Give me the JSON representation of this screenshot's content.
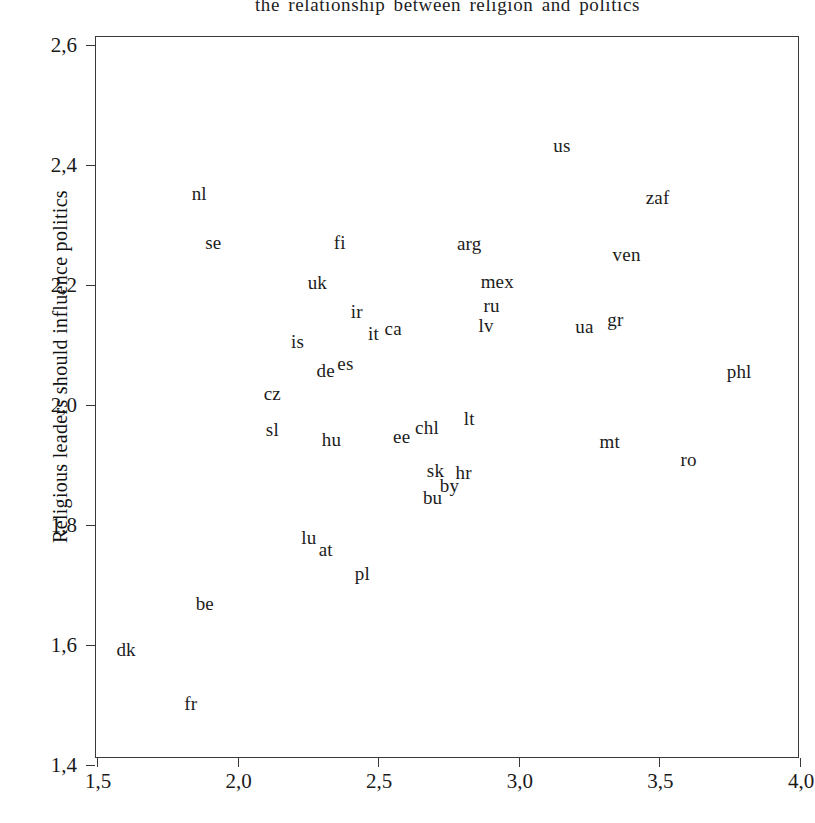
{
  "chart_data": {
    "type": "scatter",
    "title": "the relationship between religion and politics",
    "xlabel": "",
    "ylabel": "Religious leaders should influence politics",
    "xlim": [
      1.5,
      4.0
    ],
    "ylim": [
      1.4,
      2.6
    ],
    "xticks": [
      "1,5",
      "2,0",
      "2,5",
      "3,0",
      "3,5",
      "4,0"
    ],
    "xtick_values": [
      1.5,
      2.0,
      2.5,
      3.0,
      3.5,
      4.0
    ],
    "yticks": [
      "1,4",
      "1,6",
      "1,8",
      "2,0",
      "2,2",
      "2,4",
      "2,6"
    ],
    "ytick_values": [
      1.4,
      1.6,
      1.8,
      2.0,
      2.2,
      2.4,
      2.6
    ],
    "grid": false,
    "legend": null,
    "marker_style": "text-label",
    "decimal_separator": ",",
    "points": [
      {
        "label": "nl",
        "x": 1.86,
        "y": 2.355
      },
      {
        "label": "se",
        "x": 1.91,
        "y": 2.273
      },
      {
        "label": "fi",
        "x": 2.36,
        "y": 2.273
      },
      {
        "label": "arg",
        "x": 2.82,
        "y": 2.272
      },
      {
        "label": "us",
        "x": 3.15,
        "y": 2.435
      },
      {
        "label": "zaf",
        "x": 3.49,
        "y": 2.348
      },
      {
        "label": "ven",
        "x": 3.38,
        "y": 2.253
      },
      {
        "label": "uk",
        "x": 2.28,
        "y": 2.207
      },
      {
        "label": "mex",
        "x": 2.92,
        "y": 2.208
      },
      {
        "label": "ru",
        "x": 2.9,
        "y": 2.168
      },
      {
        "label": "ir",
        "x": 2.42,
        "y": 2.158
      },
      {
        "label": "lv",
        "x": 2.88,
        "y": 2.135
      },
      {
        "label": "ua",
        "x": 3.23,
        "y": 2.133
      },
      {
        "label": "gr",
        "x": 3.34,
        "y": 2.145
      },
      {
        "label": "it",
        "x": 2.48,
        "y": 2.122
      },
      {
        "label": "ca",
        "x": 2.55,
        "y": 2.13
      },
      {
        "label": "is",
        "x": 2.21,
        "y": 2.108
      },
      {
        "label": "de",
        "x": 2.31,
        "y": 2.06
      },
      {
        "label": "es",
        "x": 2.38,
        "y": 2.072
      },
      {
        "label": "phl",
        "x": 3.78,
        "y": 2.058
      },
      {
        "label": "cz",
        "x": 2.12,
        "y": 2.022
      },
      {
        "label": "lt",
        "x": 2.82,
        "y": 1.98
      },
      {
        "label": "sl",
        "x": 2.12,
        "y": 1.962
      },
      {
        "label": "chl",
        "x": 2.67,
        "y": 1.965
      },
      {
        "label": "ee",
        "x": 2.58,
        "y": 1.95
      },
      {
        "label": "hu",
        "x": 2.33,
        "y": 1.945
      },
      {
        "label": "mt",
        "x": 3.32,
        "y": 1.942
      },
      {
        "label": "ro",
        "x": 3.6,
        "y": 1.912
      },
      {
        "label": "sk",
        "x": 2.7,
        "y": 1.893
      },
      {
        "label": "hr",
        "x": 2.8,
        "y": 1.89
      },
      {
        "label": "by",
        "x": 2.75,
        "y": 1.868
      },
      {
        "label": "bu",
        "x": 2.69,
        "y": 1.848
      },
      {
        "label": "lu",
        "x": 2.25,
        "y": 1.782
      },
      {
        "label": "at",
        "x": 2.31,
        "y": 1.762
      },
      {
        "label": "pl",
        "x": 2.44,
        "y": 1.722
      },
      {
        "label": "be",
        "x": 1.88,
        "y": 1.672
      },
      {
        "label": "dk",
        "x": 1.6,
        "y": 1.595
      },
      {
        "label": "fr",
        "x": 1.83,
        "y": 1.505
      }
    ]
  },
  "axes": {
    "y_label_text": "Religious leaders should influence politics",
    "x_label_text": ""
  }
}
